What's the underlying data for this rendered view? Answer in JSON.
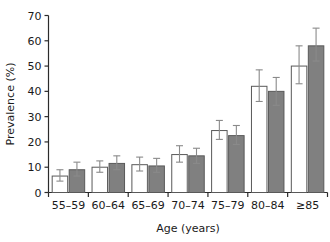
{
  "chart_data": {
    "type": "bar",
    "title": "",
    "xlabel": "Age (years)",
    "ylabel": "Prevalence (%)",
    "categories": [
      "55–59",
      "60–64",
      "65–69",
      "70–74",
      "75–79",
      "80–84",
      "≥85"
    ],
    "ylim": [
      0,
      70
    ],
    "yticks": [
      0,
      10,
      20,
      30,
      40,
      50,
      60,
      70
    ],
    "ytick_labels": [
      "0",
      "10",
      "20",
      "30",
      "40",
      "50",
      "60",
      "70"
    ],
    "grid": false,
    "legend": "none",
    "series": [
      {
        "name": "series-1",
        "fill": "#ffffff",
        "stroke": "#595959",
        "values": [
          6.5,
          10.0,
          11.0,
          15.0,
          24.5,
          42.0,
          50.0
        ],
        "err_low": [
          4.5,
          8.0,
          8.5,
          12.0,
          21.0,
          36.0,
          43.0
        ],
        "err_high": [
          9.0,
          12.5,
          14.0,
          18.5,
          28.5,
          48.5,
          58.0
        ]
      },
      {
        "name": "series-2",
        "fill": "#808080",
        "stroke": "#595959",
        "values": [
          9.0,
          11.5,
          10.5,
          14.5,
          22.5,
          40.0,
          58.0
        ],
        "err_low": [
          6.5,
          9.0,
          8.0,
          11.5,
          19.0,
          34.5,
          52.0
        ],
        "err_high": [
          12.0,
          14.5,
          13.5,
          17.5,
          26.5,
          45.5,
          65.0
        ]
      }
    ]
  },
  "colors": {
    "axis": "#2b2b2b",
    "bar_open_fill": "#ffffff",
    "bar_filled_fill": "#808080",
    "bar_stroke": "#595959",
    "error_bar": "#8a8a8a",
    "text": "#1a1a1a",
    "background": "#ffffff"
  }
}
